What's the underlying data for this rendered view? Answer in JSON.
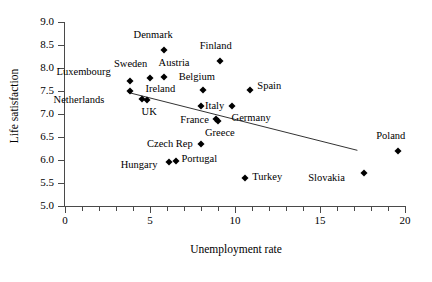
{
  "chart_data": {
    "type": "scatter",
    "title": "",
    "xlabel": "Unemployment rate",
    "ylabel": "Life satisfaction",
    "xlim": [
      0,
      20
    ],
    "ylim": [
      5.0,
      9.0
    ],
    "xticks": [
      0,
      5,
      10,
      15,
      20
    ],
    "xtick_labels": [
      "0",
      "5",
      "10",
      "15",
      "20"
    ],
    "x_minor_tick_step": 1,
    "yticks": [
      5.0,
      5.5,
      6.0,
      6.5,
      7.0,
      7.5,
      8.0,
      8.5,
      9.0
    ],
    "ytick_labels": [
      "5.0",
      "5.5",
      "6.0",
      "6.5",
      "7.0",
      "7.5",
      "8.0",
      "8.5",
      "9.0"
    ],
    "grid": false,
    "legend": null,
    "marker": "diamond",
    "marker_color": "#000000",
    "points": [
      {
        "label": "Denmark",
        "x": 5.8,
        "y": 8.4,
        "label_dx": -30,
        "label_dy": -15
      },
      {
        "label": "Finland",
        "x": 9.1,
        "y": 8.15,
        "label_dx": -20,
        "label_dy": -15
      },
      {
        "label": "Sweden",
        "x": 5.0,
        "y": 7.78,
        "label_dx": -36,
        "label_dy": -14
      },
      {
        "label": "Austria",
        "x": 5.8,
        "y": 7.8,
        "label_dx": -5,
        "label_dy": -14
      },
      {
        "label": "Luxembourg",
        "x": 3.8,
        "y": 7.72,
        "label_dx": -73,
        "label_dy": -9
      },
      {
        "label": "Belgium",
        "x": 8.1,
        "y": 7.52,
        "label_dx": -24,
        "label_dy": -13
      },
      {
        "label": "Spain",
        "x": 10.9,
        "y": 7.52,
        "label_dx": 7,
        "label_dy": -4
      },
      {
        "label": "Netherlands",
        "x": 3.8,
        "y": 7.5,
        "label_dx": -76,
        "label_dy": 9
      },
      {
        "label": "Ireland",
        "x": 4.5,
        "y": 7.32,
        "label_dx": 4,
        "label_dy": -10
      },
      {
        "label": "UK",
        "x": 4.8,
        "y": 7.3,
        "label_dx": -5,
        "label_dy": 12
      },
      {
        "label": "Italy",
        "x": 8.0,
        "y": 7.18,
        "label_dx": 4,
        "label_dy": 0
      },
      {
        "label": "Germany",
        "x": 9.8,
        "y": 7.18,
        "label_dx": 0,
        "label_dy": 12
      },
      {
        "label": "France",
        "x": 8.9,
        "y": 6.9,
        "label_dx": -36,
        "label_dy": 1
      },
      {
        "label": "Greece",
        "x": 9.0,
        "y": 6.85,
        "label_dx": -13,
        "label_dy": 12
      },
      {
        "label": "Czech Rep",
        "x": 8.0,
        "y": 6.35,
        "label_dx": -54,
        "label_dy": 0
      },
      {
        "label": "Poland",
        "x": 19.6,
        "y": 6.2,
        "label_dx": -22,
        "label_dy": -15
      },
      {
        "label": "Portugal",
        "x": 6.5,
        "y": 5.98,
        "label_dx": 6,
        "label_dy": -2
      },
      {
        "label": "Hungary",
        "x": 6.1,
        "y": 5.95,
        "label_dx": -48,
        "label_dy": 3
      },
      {
        "label": "Slovakia",
        "x": 17.6,
        "y": 5.72,
        "label_dx": -56,
        "label_dy": 5
      },
      {
        "label": "Turkey",
        "x": 10.6,
        "y": 5.6,
        "label_dx": 7,
        "label_dy": -1
      }
    ],
    "trendline": {
      "x_start": 3.7,
      "y_start": 7.47,
      "x_end": 17.2,
      "y_end": 6.21
    }
  }
}
